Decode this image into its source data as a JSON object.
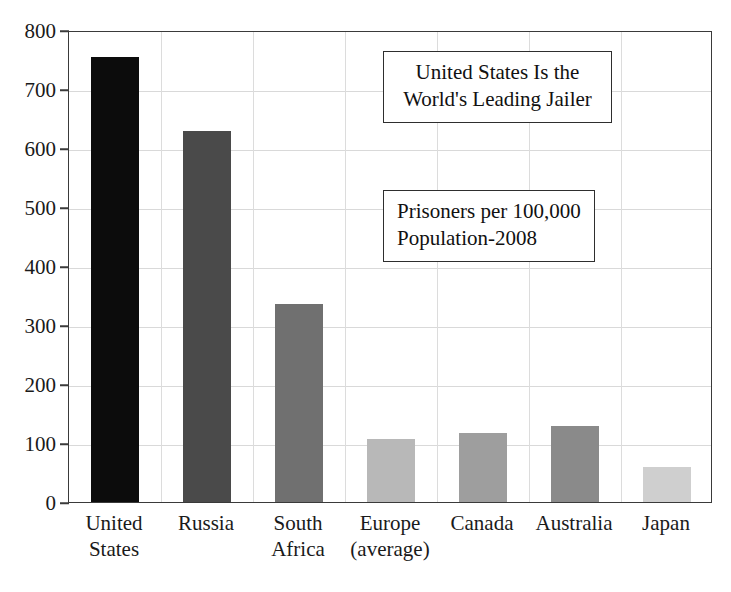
{
  "chart_data": {
    "type": "bar",
    "title": "United States Is the World's Leading Jailer",
    "subtitle": "Prisoners per 100,000 Population-2008",
    "xlabel": "",
    "ylabel": "",
    "ylim": [
      0,
      800
    ],
    "grid": true,
    "legend": "none",
    "categories": [
      "United\nStates",
      "Russia",
      "South\nAfrica",
      "Europe\n(average)",
      "Canada",
      "Australia",
      "Japan"
    ],
    "values": [
      755,
      628,
      335,
      107,
      117,
      128,
      60
    ],
    "bar_colors": [
      "#0c0c0c",
      "#4a4a4a",
      "#707070",
      "#b8b8b8",
      "#9e9e9e",
      "#8a8a8a",
      "#cfcfcf"
    ],
    "y_ticks": [
      "0",
      "100",
      "200",
      "300",
      "400",
      "500",
      "600",
      "700",
      "800"
    ],
    "y_tick_values": [
      0,
      100,
      200,
      300,
      400,
      500,
      600,
      700,
      800
    ]
  },
  "annotations": {
    "title_box": {
      "line1": "United States Is the",
      "line2": "World's Leading Jailer"
    },
    "subtitle_box": {
      "line1": "Prisoners per 100,000",
      "line2": "Population-2008"
    }
  }
}
